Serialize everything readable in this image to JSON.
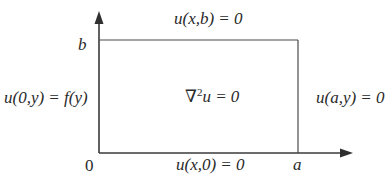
{
  "diagram": {
    "type": "boundary-value-problem-rectangle",
    "colors": {
      "line": "#3a3a3a",
      "text": "#2a2a2a",
      "background": "#ffffff"
    },
    "axes": {
      "origin_label": "0",
      "x_end_label": "a",
      "y_end_label": "b"
    },
    "boundary_conditions": {
      "top": "u(x,b) = 0",
      "left": "u(0,y) = f(y)",
      "right": "u(a,y) = 0",
      "bottom": "u(x,0) = 0"
    },
    "equation": {
      "operator": "∇",
      "power": "2",
      "rest": "u = 0"
    }
  }
}
